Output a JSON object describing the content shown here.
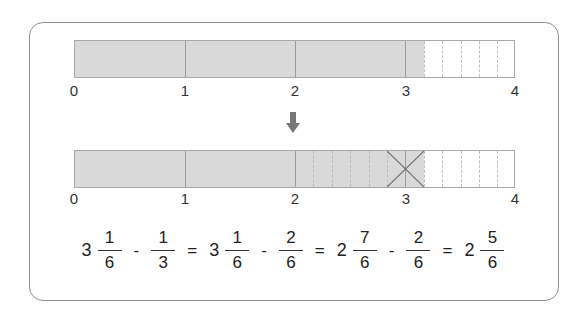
{
  "diagram": {
    "number_line": {
      "min": 0,
      "max": 4,
      "tick_labels": [
        "0",
        "1",
        "2",
        "3",
        "4"
      ]
    },
    "bar_top": {
      "shaded_value": "3 1/6",
      "shaded_fraction": 3.1667,
      "unit_divisions_after_3": 6,
      "description": "Shaded from 0 to 3 1/6; segment 3-4 split into sixths"
    },
    "arrow": "down-arrow",
    "bar_bottom": {
      "shaded_value": "3 1/6",
      "shaded_fraction": 3.1667,
      "crossed_out_from": 2.8333,
      "crossed_out_to": 3.1667,
      "crossed_out_amount": "2/6",
      "description": "Segment 2-3 split into sixths; 2/6 crossed out with an X"
    },
    "colors": {
      "shade": "#d9d9d9",
      "border": "#a8a8a8",
      "frame": "#8f8f8f",
      "arrow": "#777777"
    },
    "equation": {
      "terms": [
        {
          "whole": "3",
          "num": "1",
          "den": "6"
        },
        {
          "op": "-"
        },
        {
          "whole": "",
          "num": "1",
          "den": "3"
        },
        {
          "op": "="
        },
        {
          "whole": "3",
          "num": "1",
          "den": "6"
        },
        {
          "op": "-"
        },
        {
          "whole": "",
          "num": "2",
          "den": "6"
        },
        {
          "op": "="
        },
        {
          "whole": "2",
          "num": "7",
          "den": "6"
        },
        {
          "op": "-"
        },
        {
          "whole": "",
          "num": "2",
          "den": "6"
        },
        {
          "op": "="
        },
        {
          "whole": "2",
          "num": "5",
          "den": "6"
        }
      ]
    }
  }
}
